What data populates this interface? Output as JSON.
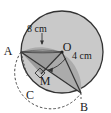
{
  "figure": {
    "type": "geometry-diagram",
    "canvas": {
      "width": 111,
      "height": 113,
      "background": "#ffffff"
    },
    "colors": {
      "circle_fill": "#c9c9c9",
      "segment_fill": "#a8a8a8",
      "wedge_fill": "#9a9a9a",
      "stroke": "#333333",
      "dashed_stroke": "#4a4a4a",
      "text": "#1a1a1a"
    },
    "point_labels": [
      {
        "name": "A",
        "text": "A",
        "x": 8,
        "y": 52
      },
      {
        "name": "O",
        "text": "O",
        "x": 67,
        "y": 48
      },
      {
        "name": "B",
        "text": "B",
        "x": 84,
        "y": 108
      },
      {
        "name": "C",
        "text": "C",
        "x": 30,
        "y": 96
      },
      {
        "name": "M",
        "text": "M",
        "x": 45,
        "y": 82
      }
    ],
    "dimension_labels": [
      {
        "name": "chord-length",
        "text": "8 cm",
        "x": 27,
        "y": 30
      },
      {
        "name": "radius-length",
        "text": "4 cm",
        "x": 72,
        "y": 57
      }
    ],
    "circle": {
      "cx": 62,
      "cy": 52,
      "r": 41
    },
    "points": {
      "A": {
        "x": 21,
        "y": 52
      },
      "O": {
        "x": 62,
        "y": 52
      },
      "B": {
        "x": 81,
        "y": 93
      },
      "C": {
        "x": 38,
        "y": 90
      },
      "M": {
        "x": 41,
        "y": 74
      }
    }
  }
}
